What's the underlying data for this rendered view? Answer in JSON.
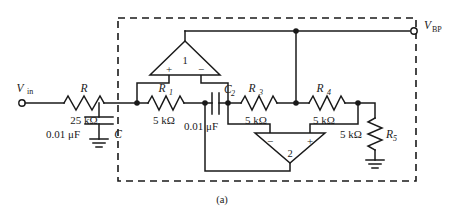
{
  "figure": {
    "caption": "(a)",
    "type": "circuit-schematic"
  },
  "terminals": [
    {
      "name": "input-terminal",
      "label": "V",
      "subscript": "in",
      "x": 22,
      "y": 103
    },
    {
      "name": "output-terminal",
      "label": "V",
      "subscript": "BP",
      "x": 414,
      "y": 25
    }
  ],
  "components": {
    "resistors": [
      {
        "id": "R",
        "ref": "R",
        "sub": "",
        "value": "25 kΩ",
        "orientation": "horizontal"
      },
      {
        "id": "R1",
        "ref": "R",
        "sub": "1",
        "value": "5 kΩ",
        "orientation": "horizontal"
      },
      {
        "id": "R3",
        "ref": "R",
        "sub": "3",
        "value": "5 kΩ",
        "orientation": "horizontal"
      },
      {
        "id": "R4",
        "ref": "R",
        "sub": "4",
        "value": "5 kΩ",
        "orientation": "horizontal"
      },
      {
        "id": "R5",
        "ref": "R",
        "sub": "5",
        "value": "5 kΩ",
        "orientation": "vertical"
      }
    ],
    "capacitors": [
      {
        "id": "C",
        "ref": "C",
        "sub": "",
        "value": "0.01 μF",
        "orientation": "vertical"
      },
      {
        "id": "C2",
        "ref": "C",
        "sub": "2",
        "value": "0.01 μF",
        "orientation": "horizontal"
      }
    ],
    "opamps": [
      {
        "id": "A1",
        "number": "1",
        "plus": "+",
        "minus": "−",
        "left_input": "+",
        "right_input": "−"
      },
      {
        "id": "A2",
        "number": "2",
        "plus": "+",
        "minus": "−",
        "left_input": "−",
        "right_input": "+"
      }
    ],
    "grounds": [
      {
        "id": "GND-C",
        "attached_to": "C"
      },
      {
        "id": "GND-R5",
        "attached_to": "R5"
      }
    ]
  },
  "colors": {
    "ink": "#1a1a1a",
    "background": "#ffffff"
  }
}
